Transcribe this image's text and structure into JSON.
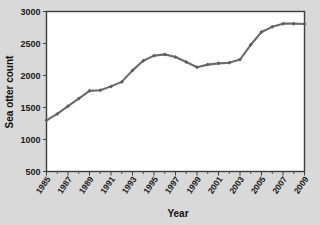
{
  "chart_data": {
    "type": "line",
    "title": "",
    "xlabel": "Year",
    "ylabel": "Sea otter count",
    "xlim": [
      1985,
      2009
    ],
    "ylim": [
      500,
      3000
    ],
    "ytick_labels": [
      "500",
      "1000",
      "1500",
      "2000",
      "2500",
      "3000"
    ],
    "yticks": [
      500,
      1000,
      1500,
      2000,
      2500,
      3000
    ],
    "xtick_labels": [
      "1985",
      "1987",
      "1989",
      "1991",
      "1993",
      "1995",
      "1997",
      "1999",
      "2001",
      "2003",
      "2005",
      "2007",
      "2009"
    ],
    "xticks": [
      1985,
      1987,
      1989,
      1991,
      1993,
      1995,
      1997,
      1999,
      2001,
      2003,
      2005,
      2007,
      2009
    ],
    "grid": false,
    "legend": "none",
    "marker": "diamond",
    "line_color": "#6b6b6b",
    "marker_color": "#5f5f5f",
    "plot_background": "#ffffff",
    "figure_background": "#d9d9d9",
    "x": [
      1985,
      1986,
      1987,
      1988,
      1989,
      1990,
      1991,
      1992,
      1993,
      1994,
      1995,
      1996,
      1997,
      1998,
      1999,
      2000,
      2001,
      2002,
      2003,
      2004,
      2005,
      2006,
      2007,
      2008,
      2009
    ],
    "values": [
      1300,
      1400,
      1520,
      1640,
      1760,
      1770,
      1830,
      1900,
      2080,
      2230,
      2310,
      2330,
      2290,
      2210,
      2130,
      2170,
      2190,
      2200,
      2250,
      2480,
      2680,
      2760,
      2810,
      2810,
      2805
    ],
    "series": [
      {
        "name": "Sea otter count",
        "values": [
          1300,
          1400,
          1520,
          1640,
          1760,
          1770,
          1830,
          1900,
          2080,
          2230,
          2310,
          2330,
          2290,
          2210,
          2130,
          2170,
          2190,
          2200,
          2250,
          2480,
          2680,
          2760,
          2810,
          2810,
          2805
        ]
      }
    ]
  }
}
